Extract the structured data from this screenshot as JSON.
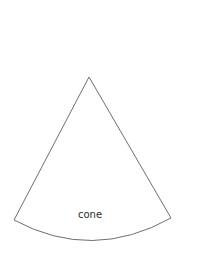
{
  "diagram": {
    "type": "cone-net-sector",
    "label": "cone",
    "colors": {
      "background": "#ffffff",
      "outline": "#6f6f6f",
      "label": "#2a2a2a"
    },
    "geometry": {
      "apex": [
        89,
        77
      ],
      "left_corner": [
        14,
        220
      ],
      "right_corner": [
        171,
        218
      ],
      "arc_bottom_y": 240
    }
  }
}
